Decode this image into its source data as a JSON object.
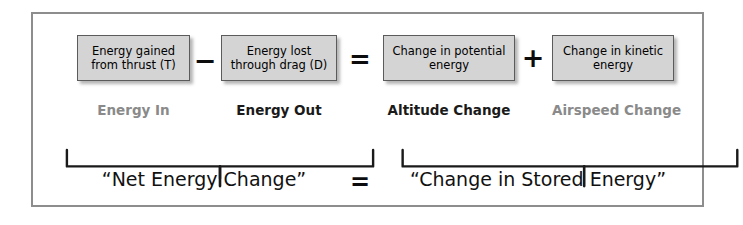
{
  "diagram": {
    "panel_border_color": "#8d8d8d",
    "box_fill_color": "#d4d4d4",
    "box_border_color": "#5b5b5b",
    "dim_label_color": "#8a8a8a",
    "strong_label_color": "#1a1a1a",
    "boxes": [
      {
        "id": "thrust",
        "text": "Energy gained\nfrom thrust (T)"
      },
      {
        "id": "drag",
        "text": "Energy lost\nthrough drag (D)"
      },
      {
        "id": "potential",
        "text": "Change in potential\nenergy"
      },
      {
        "id": "kinetic",
        "text": "Change in kinetic\nenergy"
      }
    ],
    "operators": {
      "minus": "−",
      "equals": "=",
      "plus": "+",
      "equals_bottom": "="
    },
    "labels": [
      {
        "id": "energy-in",
        "text": "Energy In",
        "emphasis": "dim"
      },
      {
        "id": "energy-out",
        "text": "Energy Out",
        "emphasis": "strong"
      },
      {
        "id": "altitude-change",
        "text": "Altitude Change",
        "emphasis": "strong"
      },
      {
        "id": "airspeed-change",
        "text": "Airspeed Change",
        "emphasis": "dim"
      }
    ],
    "summaries": {
      "left": "“Net Energy Change”",
      "right": "“Change in Stored Energy”"
    }
  }
}
